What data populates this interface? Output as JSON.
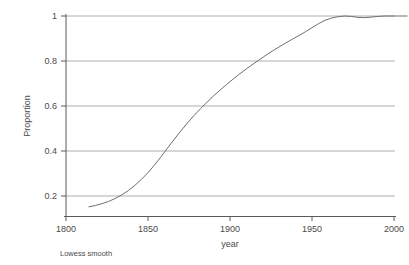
{
  "chart_data": {
    "type": "line",
    "title": "",
    "subtitle": "",
    "xlabel": "year",
    "ylabel": "Proportion",
    "note": "Lowess smooth",
    "xlim": [
      1789,
      2012
    ],
    "ylim": [
      0.13,
      1.02
    ],
    "xticks": [
      1800,
      1850,
      1900,
      1950,
      2000
    ],
    "xticklabels": [
      "1800",
      "1850",
      "1900",
      "1950",
      "2000"
    ],
    "yticks": [
      0.2,
      0.4,
      0.6,
      0.8,
      1
    ],
    "yticklabels": [
      "0.2",
      "0.4",
      "0.6",
      "0.8",
      "1"
    ],
    "grid": "horizontal",
    "legend": "none",
    "series": [
      {
        "name": "Lowess smooth",
        "color": "#6e6e6e",
        "x": [
          1814,
          1818,
          1822,
          1826,
          1830,
          1834,
          1838,
          1842,
          1846,
          1850,
          1854,
          1858,
          1862,
          1866,
          1870,
          1874,
          1878,
          1882,
          1886,
          1890,
          1894,
          1898,
          1902,
          1906,
          1910,
          1914,
          1918,
          1922,
          1926,
          1930,
          1934,
          1938,
          1942,
          1946,
          1950,
          1954,
          1958,
          1962,
          1966,
          1970,
          1974,
          1978,
          1982,
          1986,
          1990,
          1994,
          1998,
          2002,
          2006,
          2008
        ],
        "y": [
          0.152,
          0.158,
          0.166,
          0.176,
          0.189,
          0.205,
          0.224,
          0.247,
          0.274,
          0.304,
          0.338,
          0.375,
          0.414,
          0.452,
          0.489,
          0.524,
          0.557,
          0.588,
          0.617,
          0.645,
          0.671,
          0.696,
          0.72,
          0.743,
          0.765,
          0.786,
          0.806,
          0.826,
          0.845,
          0.863,
          0.88,
          0.897,
          0.913,
          0.93,
          0.948,
          0.966,
          0.981,
          0.991,
          0.997,
          1.0,
          0.998,
          0.994,
          0.993,
          0.995,
          0.998,
          1.0,
          1.0,
          1.0,
          1.0,
          1.0
        ]
      }
    ]
  },
  "axes": {
    "y_title": "Proportion",
    "x_title": "year"
  },
  "footnote": {
    "text": "Lowess smooth"
  }
}
